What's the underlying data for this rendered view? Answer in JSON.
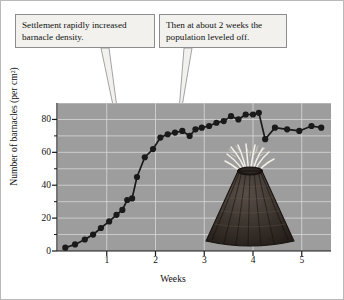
{
  "figure": {
    "background_color": "#ffffff",
    "plot_background_color": "#9d9d9d",
    "grid_color": "#d8d8d8",
    "series_color": "#1a1a1a"
  },
  "annotations": [
    {
      "name": "settlement",
      "line1": "Settlement rapidly increased",
      "line2": "barnacle density."
    },
    {
      "name": "plateau",
      "line1": "Then at about 2 weeks the",
      "line2": "population leveled off."
    }
  ],
  "illustration": {
    "label": "barnacle-illustration",
    "shell_color": "#3a332e",
    "cirri_color": "#f4f1e8"
  },
  "chart_data": {
    "type": "line",
    "title": "",
    "xlabel": "Weeks",
    "ylabel": "Number of barnacles (per cm²)",
    "xlim": [
      0,
      5.6
    ],
    "ylim": [
      0,
      90
    ],
    "xticks": [
      1,
      2,
      3,
      4,
      5
    ],
    "xtick_labels": [
      "1",
      "2",
      "3",
      "4",
      "5"
    ],
    "yticks": [
      0,
      20,
      40,
      60,
      80
    ],
    "ytick_labels": [
      "0",
      "20",
      "40",
      "60",
      "80"
    ],
    "yminorticks": [
      10,
      30,
      50,
      70
    ],
    "grid": true,
    "grid_interval": 10,
    "marker": "filled-circle",
    "x": [
      0.15,
      0.35,
      0.55,
      0.72,
      0.88,
      1.05,
      1.2,
      1.32,
      1.42,
      1.52,
      1.62,
      1.78,
      1.95,
      2.1,
      2.25,
      2.4,
      2.55,
      2.7,
      2.82,
      2.95,
      3.1,
      3.25,
      3.4,
      3.55,
      3.7,
      3.85,
      4.0,
      4.12,
      4.25,
      4.45,
      4.7,
      4.95,
      5.2,
      5.4
    ],
    "y": [
      2,
      4,
      7,
      10,
      14,
      18,
      22,
      25,
      31,
      32,
      45,
      57,
      62,
      69,
      71,
      72,
      73,
      70,
      74,
      75,
      76,
      78,
      79,
      82,
      80,
      83,
      83,
      84,
      68,
      75,
      74,
      73,
      76,
      75
    ]
  }
}
